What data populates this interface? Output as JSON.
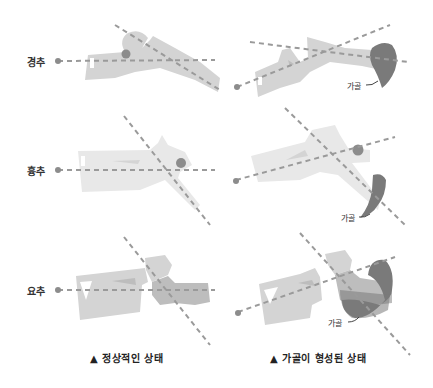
{
  "rows": [
    {
      "label": "경추"
    },
    {
      "label": "흉추"
    },
    {
      "label": "요추"
    }
  ],
  "callout_label": "가골",
  "captions": {
    "left": "▲ 정상적인 상태",
    "right": "▲ 가골이 형성된 상태"
  },
  "colors": {
    "bone_light": "#d4d4d4",
    "bone_lighter": "#e6e6e6",
    "bone_mid": "#b8b8b8",
    "callus": "#7a7a7a",
    "dash": "#9a9a9a",
    "dot": "#8c8c8c"
  }
}
